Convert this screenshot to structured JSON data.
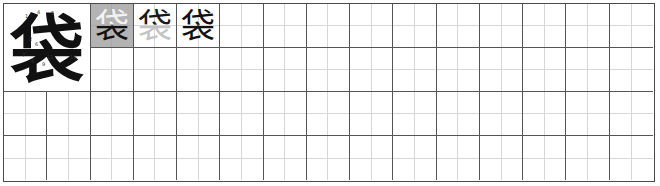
{
  "worksheet": {
    "character": "袋",
    "grid": {
      "columns": 15,
      "rows": 4
    },
    "stroke_numbers": [
      "1",
      "2",
      "3",
      "4",
      "5",
      "6",
      "7",
      "8",
      "9",
      "10",
      "11"
    ],
    "practice_cells": [
      {
        "char": "袋",
        "style": "shaded-progress",
        "top_color": "#f2f2f2",
        "bottom_color": "#111111",
        "bg": "#b3b3b3"
      },
      {
        "char": "袋",
        "style": "trace-progress",
        "top_color": "#1a1a1a",
        "bottom_color": "#c4c4c4",
        "bg": "#ffffff"
      },
      {
        "char": "袋",
        "style": "full",
        "top_color": "#111111",
        "bottom_color": "#111111",
        "bg": "#ffffff"
      }
    ],
    "colors": {
      "cell_border": "#555555",
      "guide_line": "#d6d6d6",
      "shaded_bg": "#b3b3b3",
      "ink": "#111111"
    }
  }
}
